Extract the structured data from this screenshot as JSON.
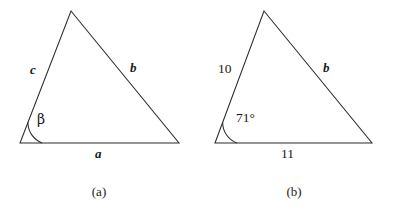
{
  "figure": {
    "background_color": "#ffffff",
    "stroke_color": "#2b2b2b",
    "width": 394,
    "height": 209
  },
  "panels": [
    {
      "id": "panel-a",
      "caption": "(a)",
      "caption_x": 99,
      "caption_y": 184,
      "triangle": {
        "apex": [
          71,
          11
        ],
        "bottom_left": [
          20,
          143
        ],
        "bottom_right": [
          179,
          143
        ]
      },
      "angle_arc": {
        "vertex": [
          20,
          143
        ],
        "radius": 22
      },
      "labels": [
        {
          "name": "side-label-c",
          "text": "c",
          "style": "italic",
          "x": 30,
          "y": 63
        },
        {
          "name": "side-label-b",
          "text": "b",
          "style": "italic",
          "x": 130,
          "y": 61
        },
        {
          "name": "side-label-a",
          "text": "a",
          "style": "italic",
          "x": 95,
          "y": 147
        },
        {
          "name": "angle-label-beta",
          "text": "β",
          "style": "greek",
          "x": 37,
          "y": 112
        }
      ]
    },
    {
      "id": "panel-b",
      "caption": "(b)",
      "caption_x": 294,
      "caption_y": 184,
      "triangle": {
        "apex": [
          264,
          11
        ],
        "bottom_left": [
          215,
          143
        ],
        "bottom_right": [
          372,
          143
        ]
      },
      "angle_arc": {
        "vertex": [
          215,
          143
        ],
        "radius": 22
      },
      "labels": [
        {
          "name": "side-label-10",
          "text": "10",
          "style": "num",
          "x": 218,
          "y": 62
        },
        {
          "name": "side-label-b",
          "text": "b",
          "style": "italic",
          "x": 323,
          "y": 61
        },
        {
          "name": "side-label-11",
          "text": "11",
          "style": "num",
          "x": 281,
          "y": 147
        },
        {
          "name": "angle-label-71",
          "text": "71°",
          "style": "num",
          "x": 236,
          "y": 111
        }
      ]
    }
  ],
  "chart_data": {
    "type": "diagram",
    "figures": [
      {
        "label": "(a)",
        "description": "Triangle with generic symbolic side and angle labels",
        "sides": [
          {
            "name": "a",
            "position": "base",
            "value": "a"
          },
          {
            "name": "b",
            "position": "right",
            "value": "b"
          },
          {
            "name": "c",
            "position": "left",
            "value": "c"
          }
        ],
        "angles": [
          {
            "name": "beta",
            "symbol": "β",
            "vertex": "bottom-left"
          }
        ]
      },
      {
        "label": "(b)",
        "description": "Same triangle with numeric values substituted",
        "sides": [
          {
            "name": "a",
            "position": "base",
            "value": "11"
          },
          {
            "name": "b",
            "position": "right",
            "value": "b"
          },
          {
            "name": "c",
            "position": "left",
            "value": "10"
          }
        ],
        "angles": [
          {
            "name": "beta",
            "symbol": "71°",
            "vertex": "bottom-left",
            "degrees": 71
          }
        ]
      }
    ]
  }
}
